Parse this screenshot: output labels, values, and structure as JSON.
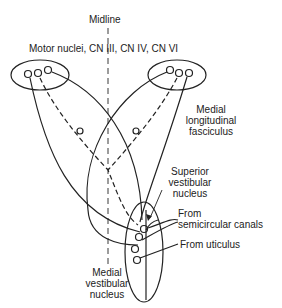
{
  "labels": {
    "midline": "Midline",
    "motor_nuclei": "Motor nuclei, CN III, CN IV, CN VI",
    "mlf_line1": "Medial",
    "mlf_line2": "longitudinal",
    "mlf_line3": "fasciculus",
    "svn_line1": "Superior",
    "svn_line2": "vestibular",
    "svn_line3": "nucleus",
    "scc_line1": "From",
    "scc_line2": "semicircular canals",
    "utriculus": "From uticulus",
    "mvn_line1": "Medial",
    "mvn_line2": "vestibular",
    "mvn_line3": "nucleus"
  },
  "colors": {
    "line": "#222222",
    "background": "#ffffff"
  }
}
